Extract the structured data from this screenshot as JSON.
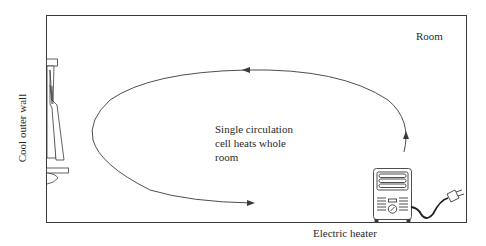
{
  "diagram": {
    "labels": {
      "room": "Room",
      "circulation": "Single circulation cell heats whole room",
      "heater": "Electric heater",
      "wall": "Cool outer wall"
    },
    "elements": [
      {
        "name": "room-boundary",
        "type": "rectangle"
      },
      {
        "name": "window-with-curtains",
        "location": "left wall"
      },
      {
        "name": "circulation-loop",
        "type": "ellipse-arrow",
        "direction": "rises at heater, flows across ceiling, descends at cool wall, returns along floor"
      },
      {
        "name": "electric-heater",
        "location": "bottom right",
        "with": "power cord and plug"
      }
    ],
    "colors": {
      "line": "#3a3a3a",
      "background": "#ffffff"
    }
  }
}
